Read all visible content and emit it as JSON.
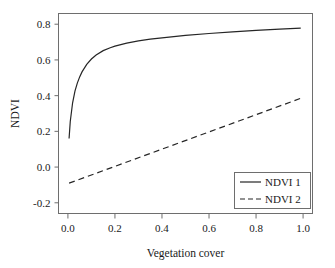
{
  "chart_data": {
    "type": "line",
    "title": "",
    "xlabel": "Vegetation cover",
    "ylabel": "NDVI",
    "xlim": [
      -0.04,
      1.04
    ],
    "ylim": [
      -0.26,
      0.86
    ],
    "xticks": [
      0.0,
      0.2,
      0.4,
      0.6,
      0.8,
      1.0
    ],
    "xtick_labels": [
      "0.0",
      "0.2",
      "0.4",
      "0.6",
      "0.8",
      "1.0"
    ],
    "yticks": [
      -0.2,
      0.0,
      0.2,
      0.4,
      0.6,
      0.8
    ],
    "ytick_labels": [
      "-0.2",
      "0.0",
      "0.2",
      "0.4",
      "0.6",
      "0.8"
    ],
    "grid": false,
    "legend_position": "lower-right",
    "series": [
      {
        "name": "NDVI 1",
        "style": "solid",
        "color": "#262626",
        "x": [
          0.005,
          0.01,
          0.02,
          0.03,
          0.04,
          0.05,
          0.06,
          0.08,
          0.1,
          0.12,
          0.15,
          0.18,
          0.2,
          0.25,
          0.3,
          0.35,
          0.4,
          0.5,
          0.6,
          0.7,
          0.8,
          0.9,
          0.99
        ],
        "values": [
          0.16,
          0.255,
          0.36,
          0.425,
          0.47,
          0.505,
          0.533,
          0.575,
          0.605,
          0.628,
          0.652,
          0.668,
          0.677,
          0.694,
          0.707,
          0.716,
          0.724,
          0.737,
          0.748,
          0.757,
          0.765,
          0.772,
          0.778
        ]
      },
      {
        "name": "NDVI 2",
        "style": "dashed",
        "color": "#262626",
        "x": [
          0.005,
          0.99
        ],
        "values": [
          -0.09,
          0.385
        ]
      }
    ]
  },
  "legend": {
    "entries": [
      {
        "label": "NDVI 1",
        "style": "solid"
      },
      {
        "label": "NDVI 2",
        "style": "dashed"
      }
    ]
  },
  "colors": {
    "ink": "#262626",
    "frame": "#6e6e6e",
    "background": "#ffffff"
  }
}
